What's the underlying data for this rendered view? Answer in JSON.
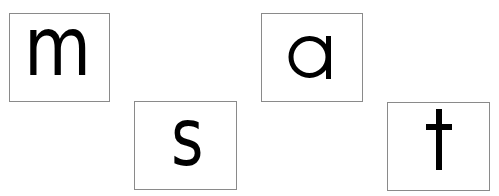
{
  "cards": [
    {
      "id": "m",
      "letter": "m"
    },
    {
      "id": "s",
      "letter": "s"
    },
    {
      "id": "a",
      "letter": "a"
    },
    {
      "id": "t",
      "letter": "t"
    }
  ],
  "colors": {
    "border": "#8a8a8a",
    "letter": "#000000",
    "background": "#ffffff"
  }
}
